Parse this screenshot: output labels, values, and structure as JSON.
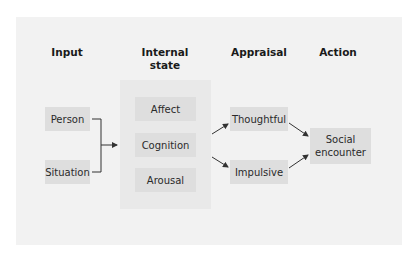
{
  "diagram": {
    "columns": {
      "input": "Input",
      "internal_state_line1": "Internal",
      "internal_state_line2": "state",
      "appraisal": "Appraisal",
      "action": "Action"
    },
    "input_nodes": [
      "Person",
      "Situation"
    ],
    "internal_state_nodes": [
      "Affect",
      "Cognition",
      "Arousal"
    ],
    "appraisal_nodes": [
      "Thoughtful",
      "Impulsive"
    ],
    "action_node": {
      "line1": "Social",
      "line2": "encounter"
    },
    "colors": {
      "page": "#ffffff",
      "panel": "#f2f2f2",
      "group": "#e9e9e9",
      "box": "#dedede",
      "line": "#333333"
    }
  }
}
